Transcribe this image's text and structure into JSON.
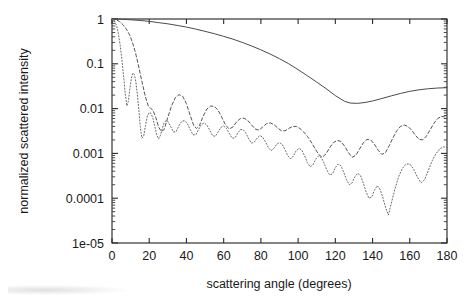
{
  "figure": {
    "background": "#ffffff",
    "ink_color": "#3d3d3d"
  },
  "chart_data": {
    "type": "line",
    "title": "",
    "subtitle": "",
    "xlabel": "scattering angle (degrees)",
    "ylabel": "normalized scattered intensity",
    "xlim": [
      0,
      180
    ],
    "ylim": [
      1e-05,
      1
    ],
    "yscale": "log",
    "xscale": "linear",
    "grid": false,
    "legend": "none",
    "legend_entries": [],
    "xticks": [
      0,
      20,
      40,
      60,
      80,
      100,
      120,
      140,
      160,
      180
    ],
    "xticklabels": [
      "0",
      "20",
      "40",
      "60",
      "80",
      "100",
      "120",
      "140",
      "160",
      "180"
    ],
    "yticks": [
      1,
      0.1,
      0.01,
      0.001,
      0.0001,
      1e-05
    ],
    "yticklabels": [
      "1",
      "0.1",
      "0.01",
      "0.001",
      "0.0001",
      "1e-05"
    ],
    "annotations": [],
    "series": [
      {
        "name": "solid curve",
        "style": "solid",
        "color": "#4a4a4a",
        "x": [
          0,
          5,
          10,
          15,
          20,
          25,
          30,
          35,
          40,
          45,
          50,
          55,
          60,
          65,
          70,
          75,
          80,
          85,
          90,
          95,
          100,
          105,
          110,
          115,
          120,
          125,
          128,
          132,
          136,
          140,
          145,
          150,
          155,
          160,
          165,
          170,
          175,
          180
        ],
        "y": [
          1.0,
          0.99,
          0.96,
          0.93,
          0.885,
          0.83,
          0.78,
          0.72,
          0.66,
          0.595,
          0.53,
          0.47,
          0.41,
          0.355,
          0.3,
          0.25,
          0.205,
          0.165,
          0.13,
          0.1,
          0.074,
          0.054,
          0.039,
          0.028,
          0.0195,
          0.0145,
          0.0133,
          0.0131,
          0.0137,
          0.0148,
          0.0168,
          0.0192,
          0.0218,
          0.0243,
          0.0263,
          0.0278,
          0.0288,
          0.0293
        ]
      },
      {
        "name": "dashed curve",
        "style": "dashed",
        "color": "#555555",
        "x": [
          0,
          2,
          4,
          6,
          8,
          9.5,
          11,
          12.5,
          14,
          16,
          18,
          19.5,
          21,
          22,
          23.5,
          25,
          26.5,
          28,
          30,
          32,
          34,
          36,
          38,
          40,
          42,
          44,
          45.5,
          47,
          49,
          51,
          53,
          55,
          57,
          59,
          61,
          63,
          65,
          67,
          69,
          71,
          73,
          75,
          77,
          79,
          81,
          83,
          85,
          87,
          89,
          91,
          93,
          95,
          97,
          99,
          101,
          103,
          105,
          107,
          109,
          111,
          113,
          115,
          117,
          119,
          121,
          123,
          125,
          127,
          129,
          131,
          133,
          135,
          137,
          139,
          141,
          143,
          145,
          147,
          149,
          151,
          153,
          155,
          157,
          159,
          161,
          163,
          165,
          167,
          169,
          171,
          173,
          175,
          177,
          180
        ],
        "y": [
          1.0,
          0.97,
          0.88,
          0.74,
          0.57,
          0.44,
          0.3,
          0.185,
          0.1,
          0.042,
          0.018,
          0.0115,
          0.0099,
          0.0092,
          0.0064,
          0.0039,
          0.0031,
          0.0034,
          0.0064,
          0.0115,
          0.0175,
          0.0205,
          0.0188,
          0.0128,
          0.0071,
          0.0041,
          0.0036,
          0.0042,
          0.0068,
          0.0098,
          0.0114,
          0.0112,
          0.0092,
          0.0064,
          0.0043,
          0.0035,
          0.0039,
          0.0051,
          0.006,
          0.0061,
          0.0054,
          0.0043,
          0.0035,
          0.0033,
          0.0039,
          0.0046,
          0.0048,
          0.0044,
          0.0037,
          0.0032,
          0.0032,
          0.0036,
          0.004,
          0.004,
          0.0036,
          0.003,
          0.0024,
          0.0018,
          0.0013,
          0.00095,
          0.00082,
          0.00098,
          0.00135,
          0.00175,
          0.00195,
          0.00185,
          0.00145,
          0.00105,
          0.00082,
          0.0009,
          0.00125,
          0.00172,
          0.00205,
          0.002,
          0.0016,
          0.00118,
          0.00095,
          0.00105,
          0.0015,
          0.00225,
          0.0032,
          0.004,
          0.0043,
          0.004,
          0.0033,
          0.00255,
          0.00205,
          0.002,
          0.00245,
          0.0034,
          0.0047,
          0.006,
          0.0067,
          0.0064
        ]
      },
      {
        "name": "dotted curve",
        "style": "dotted",
        "color": "#6a6a6a",
        "x": [
          0,
          1.2,
          2.4,
          3.4,
          4.4,
          5.4,
          6.4,
          7.2,
          8.0,
          8.8,
          9.6,
          10.4,
          11.2,
          12.0,
          12.8,
          13.6,
          14.4,
          15.2,
          16.0,
          17.0,
          18.0,
          19.0,
          20.0,
          21.0,
          22.0,
          23.0,
          24.0,
          25.0,
          26.0,
          27.0,
          28.0,
          29.0,
          30.0,
          31.5,
          33.0,
          34.5,
          36.0,
          37.5,
          39.0,
          40.5,
          42.0,
          43.5,
          45.0,
          46.5,
          48.0,
          49.5,
          51.0,
          52.5,
          54.0,
          55.5,
          57.0,
          58.5,
          60.0,
          61.5,
          63.0,
          64.5,
          66.0,
          67.5,
          69.0,
          70.5,
          72.0,
          73.5,
          75.0,
          76.5,
          78.0,
          79.5,
          81.0,
          82.5,
          84.0,
          85.5,
          87.0,
          88.5,
          90.0,
          91.5,
          93.0,
          94.5,
          96.0,
          97.5,
          99.0,
          100.5,
          102.0,
          103.5,
          105.0,
          106.5,
          108.0,
          109.5,
          111.0,
          112.5,
          114.0,
          115.5,
          117.0,
          118.5,
          120.0,
          121.5,
          123.0,
          124.5,
          126.0,
          127.5,
          129.0,
          130.5,
          132.0,
          133.5,
          135.0,
          136.5,
          138.0,
          139.5,
          141.0,
          142.5,
          144.0,
          145.5,
          147.0,
          148.5,
          150.0,
          152.0,
          154.0,
          156.0,
          158.0,
          160.0,
          162.0,
          164.0,
          166.0,
          168.0,
          170.0,
          172.0,
          174.0,
          176.0,
          178.0,
          180.0
        ],
        "y": [
          1.0,
          0.92,
          0.72,
          0.48,
          0.26,
          0.115,
          0.045,
          0.02,
          0.0115,
          0.0145,
          0.028,
          0.048,
          0.062,
          0.058,
          0.04,
          0.021,
          0.0095,
          0.004,
          0.0022,
          0.0024,
          0.0042,
          0.0068,
          0.0082,
          0.0078,
          0.006,
          0.004,
          0.0026,
          0.0021,
          0.0025,
          0.0036,
          0.0048,
          0.0054,
          0.0052,
          0.004,
          0.003,
          0.0031,
          0.0042,
          0.0052,
          0.0054,
          0.0046,
          0.0034,
          0.0026,
          0.0026,
          0.0034,
          0.0044,
          0.0048,
          0.0043,
          0.0033,
          0.0025,
          0.0024,
          0.003,
          0.0038,
          0.0041,
          0.0036,
          0.0028,
          0.0022,
          0.0022,
          0.0028,
          0.0034,
          0.0034,
          0.0028,
          0.0021,
          0.0017,
          0.0018,
          0.0022,
          0.0025,
          0.0023,
          0.0018,
          0.00135,
          0.00115,
          0.0013,
          0.0016,
          0.00175,
          0.00158,
          0.0012,
          0.00088,
          0.00075,
          0.00088,
          0.00115,
          0.0013,
          0.00118,
          0.00088,
          0.00062,
          0.0005,
          0.00056,
          0.00075,
          0.00088,
          0.0008,
          0.0006,
          0.00042,
          0.00033,
          0.00035,
          0.00048,
          0.00058,
          0.00053,
          0.00038,
          0.00026,
          0.0002,
          0.00022,
          0.0003,
          0.00036,
          0.00032,
          0.00022,
          0.00014,
          0.0001,
          0.000105,
          0.00015,
          0.00019,
          0.00016,
          0.000105,
          6.2e-05,
          4.2e-05,
          7.5e-05,
          0.00016,
          0.0003,
          0.00046,
          0.00058,
          0.00058,
          0.00045,
          0.0003,
          0.00022,
          0.00026,
          0.00042,
          0.00068,
          0.00098,
          0.00125,
          0.0014,
          0.00135
        ]
      }
    ]
  }
}
